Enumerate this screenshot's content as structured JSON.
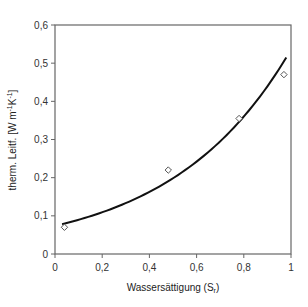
{
  "chart_data": {
    "type": "scatter",
    "title": "",
    "xlabel": "Wassersättigung (S_r)",
    "xlabel_main": "Wassersättigung (S",
    "xlabel_sub": "r",
    "xlabel_end": ")",
    "ylabel": "therm. Leitf. [W m^-1 K^-1]",
    "ylabel_main": "therm. Leitf. [W m",
    "ylabel_sup1": "-1",
    "ylabel_mid": "K",
    "ylabel_sup2": "-1",
    "ylabel_end": "]",
    "xlim": [
      0,
      1
    ],
    "ylim": [
      0,
      0.6
    ],
    "x_ticks": [
      "0",
      "0,2",
      "0,4",
      "0,6",
      "0,8",
      "1"
    ],
    "x_tick_values": [
      0,
      0.2,
      0.4,
      0.6,
      0.8,
      1.0
    ],
    "y_ticks": [
      "0",
      "0,1",
      "0,2",
      "0,3",
      "0,4",
      "0,5",
      "0,6"
    ],
    "y_tick_values": [
      0,
      0.1,
      0.2,
      0.3,
      0.4,
      0.5,
      0.6
    ],
    "grid": false,
    "legend": null,
    "series": [
      {
        "name": "Messwerte",
        "kind": "scatter",
        "marker": "diamond-open",
        "x": [
          0.04,
          0.48,
          0.78,
          0.97
        ],
        "y": [
          0.07,
          0.22,
          0.355,
          0.47
        ]
      },
      {
        "name": "Modell",
        "kind": "line",
        "x": [
          0.03,
          0.1,
          0.2,
          0.3,
          0.4,
          0.5,
          0.6,
          0.7,
          0.8,
          0.9,
          0.98
        ],
        "y": [
          0.078,
          0.089,
          0.109,
          0.133,
          0.162,
          0.198,
          0.242,
          0.295,
          0.36,
          0.44,
          0.515
        ]
      }
    ]
  },
  "colors": {
    "line": "#111111",
    "marker": "#555555",
    "axis": "#666666"
  }
}
